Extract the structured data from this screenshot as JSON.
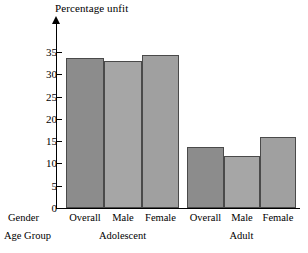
{
  "chart_data": {
    "type": "bar",
    "title": "Percentage unfit",
    "xlabel": "",
    "ylabel": "Percentage unfit",
    "ylim": [
      0,
      37
    ],
    "yticks": [
      0,
      5,
      10,
      15,
      20,
      25,
      30,
      35
    ],
    "grid": false,
    "legend": null,
    "axis_row_labels": [
      "Gender",
      "Age Group"
    ],
    "categories": [
      "Overall",
      "Male",
      "Female",
      "Overall",
      "Male",
      "Female"
    ],
    "groups": [
      {
        "name": "Adolescent",
        "categories": [
          "Overall",
          "Male",
          "Female"
        ],
        "values": [
          33.7,
          33.0,
          34.3
        ]
      },
      {
        "name": "Adult",
        "categories": [
          "Overall",
          "Male",
          "Female"
        ],
        "values": [
          13.7,
          11.7,
          16.0
        ]
      }
    ],
    "values": [
      33.7,
      33.0,
      34.3,
      13.7,
      11.7,
      16.0
    ],
    "bar_colors": [
      "#8c8c8c",
      "#a6a6a6",
      "#a0a0a0",
      "#8c8c8c",
      "#a6a6a6",
      "#a0a0a0"
    ]
  },
  "colors": {
    "bar_dark": "#8c8c8c",
    "bar_light": "#a6a6a6",
    "bar_mid": "#a0a0a0",
    "bar_border": "#4a4a4a",
    "axis": "#000000",
    "background": "#ffffff"
  }
}
